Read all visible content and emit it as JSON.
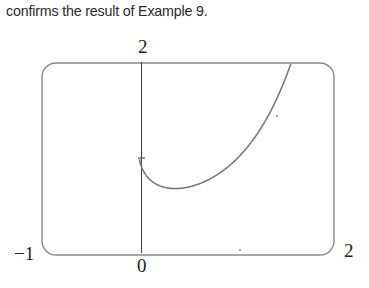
{
  "caption": "confirms the result of Example 9.",
  "chart_data": {
    "type": "line",
    "title": "",
    "function": "y = x^x",
    "xlabel": "",
    "ylabel": "",
    "xlim": [
      -1,
      2
    ],
    "ylim": [
      0,
      2
    ],
    "tick_labels": {
      "x_min": "−1",
      "x_max": "2",
      "origin": "0",
      "y_max": "2"
    },
    "y_ticks": [
      1
    ],
    "grid": false,
    "legend": null,
    "series": [
      {
        "name": "y = x^x",
        "x": [
          0.001,
          0.05,
          0.1,
          0.2,
          0.3,
          0.368,
          0.5,
          0.7,
          0.9,
          1.0,
          1.2,
          1.4,
          1.55
        ],
        "y": [
          0.99,
          0.86,
          0.79,
          0.72,
          0.7,
          0.69,
          0.71,
          0.78,
          0.91,
          1.0,
          1.24,
          1.6,
          1.97
        ]
      }
    ],
    "colors": {
      "frame": "#8a8a8a",
      "axis": "#444444",
      "curve": "#7a7a7a"
    }
  }
}
